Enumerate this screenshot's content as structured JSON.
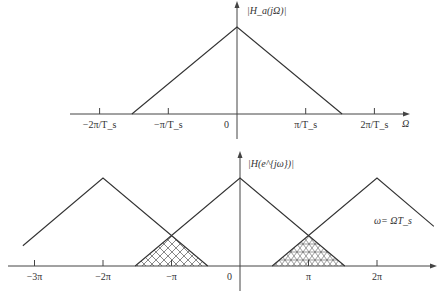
{
  "chart_data": [
    {
      "type": "line",
      "title": "",
      "ylabel": "|H_a(jΩ)|",
      "xlabel": "Ω",
      "x_units": "π/T_s",
      "x_ticks": [
        {
          "value": -2,
          "label": "−2π/T_s"
        },
        {
          "value": -1,
          "label": "−π/T_s"
        },
        {
          "value": 0,
          "label": "0"
        },
        {
          "value": 1,
          "label": "π/T_s"
        },
        {
          "value": 2,
          "label": "2π/T_s"
        }
      ],
      "xlim": [
        -2.45,
        2.5
      ],
      "ylim": [
        0,
        1.25
      ],
      "series": [
        {
          "name": "H_a spectrum",
          "x": [
            -1.53,
            0,
            1.53
          ],
          "y": [
            0,
            1,
            0
          ]
        }
      ]
    },
    {
      "type": "line",
      "title": "",
      "ylabel": "|H(e^{jω})|",
      "xlabel": "",
      "annotation": "ω= ΩT_s",
      "x_units": "π",
      "x_ticks": [
        {
          "value": -3,
          "label": "−3π"
        },
        {
          "value": -2,
          "label": "−2π"
        },
        {
          "value": -1,
          "label": "−π"
        },
        {
          "value": 0,
          "label": "0"
        },
        {
          "value": 1,
          "label": "π"
        },
        {
          "value": 2,
          "label": "2π"
        }
      ],
      "xlim": [
        -3.5,
        2.95
      ],
      "ylim": [
        0,
        1.3
      ],
      "series": [
        {
          "name": "image at −2π",
          "x": [
            -3.17,
            -2,
            -0.47
          ],
          "y": [
            0.23,
            1,
            0
          ]
        },
        {
          "name": "baseband",
          "x": [
            -1.53,
            0,
            1.53
          ],
          "y": [
            0,
            1,
            0
          ]
        },
        {
          "name": "image at 2π",
          "x": [
            0.47,
            2,
            2.83
          ],
          "y": [
            0,
            1,
            0.45
          ]
        }
      ],
      "aliasing_regions": [
        {
          "x_range": [
            -1.53,
            -0.47
          ],
          "hatch": "cross"
        },
        {
          "x_range": [
            0.47,
            1.53
          ],
          "hatch": "cross-dense"
        }
      ]
    }
  ]
}
